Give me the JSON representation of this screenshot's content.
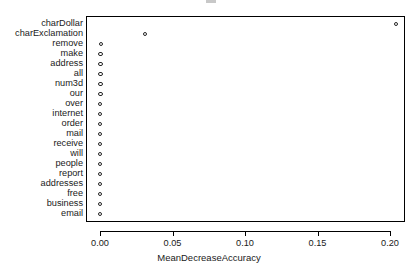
{
  "chart_data": {
    "type": "scatter",
    "title": "",
    "xlabel": "MeanDecreaseAccuracy",
    "ylabel": "",
    "xlim": [
      -0.0103,
      0.2172
    ],
    "grid": false,
    "legend": null,
    "marker": "open-circle",
    "categories": [
      "charDollar",
      "charExclamation",
      "remove",
      "make",
      "address",
      "all",
      "num3d",
      "our",
      "over",
      "internet",
      "order",
      "mail",
      "receive",
      "will",
      "people",
      "report",
      "addresses",
      "free",
      "business",
      "email"
    ],
    "values": [
      0.204,
      0.031,
      0.0005,
      0.0004,
      0.0004,
      0.0003,
      0.0003,
      0.0003,
      0.0002,
      0.0002,
      0.0002,
      0.0002,
      0.0002,
      0.0001,
      0.0001,
      0.0001,
      0.0001,
      0.0001,
      0.0001,
      0.0
    ],
    "xticks": [
      0.0,
      0.05,
      0.1,
      0.15,
      0.2
    ],
    "xticklabels": [
      "0.00",
      "0.05",
      "0.10",
      "0.15",
      "0.20"
    ]
  },
  "colors": {
    "marker_stroke": "#262626",
    "axis": "#000000",
    "text": "#1a1a1a",
    "background": "#ffffff"
  }
}
